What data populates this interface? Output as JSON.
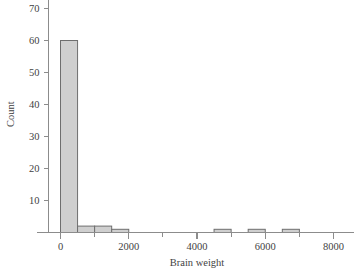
{
  "chart_data": {
    "type": "bar",
    "title": "",
    "subtitle": "",
    "xlabel": "Brain weight",
    "ylabel": "Count",
    "xlim": [
      -700,
      8600
    ],
    "ylim": [
      0,
      74
    ],
    "grid": false,
    "legend": null,
    "bin_width": 500,
    "x_ticks": [
      "0",
      "2000",
      "4000",
      "6000",
      "8000"
    ],
    "x_tick_values": [
      0,
      2000,
      4000,
      6000,
      8000
    ],
    "x_minor_tick_values": [
      1000,
      3000,
      5000,
      7000
    ],
    "y_ticks": [
      "10",
      "20",
      "30",
      "40",
      "50",
      "60",
      "70"
    ],
    "y_tick_values": [
      10,
      20,
      30,
      40,
      50,
      60,
      70
    ],
    "bin_edges": [
      0,
      500,
      1000,
      1500,
      2000,
      2500,
      3000,
      3500,
      4000,
      4500,
      5000,
      5500,
      6000,
      6500,
      7000
    ],
    "categories": [
      "0-500",
      "500-1000",
      "1000-1500",
      "1500-2000",
      "2000-2500",
      "2500-3000",
      "3000-3500",
      "3500-4000",
      "4000-4500",
      "4500-5000",
      "5000-5500",
      "5500-6000",
      "6000-6500",
      "6500-7000"
    ],
    "values": [
      60,
      2,
      2,
      1,
      0,
      0,
      0,
      0,
      0,
      1,
      0,
      1,
      0,
      1
    ],
    "bar_fill": "#cfcfcf",
    "bar_edge": "#6e6e6e",
    "axis_color": "#8c8c8c",
    "text_color": "#3f3f3f",
    "background": "#ffffff"
  }
}
